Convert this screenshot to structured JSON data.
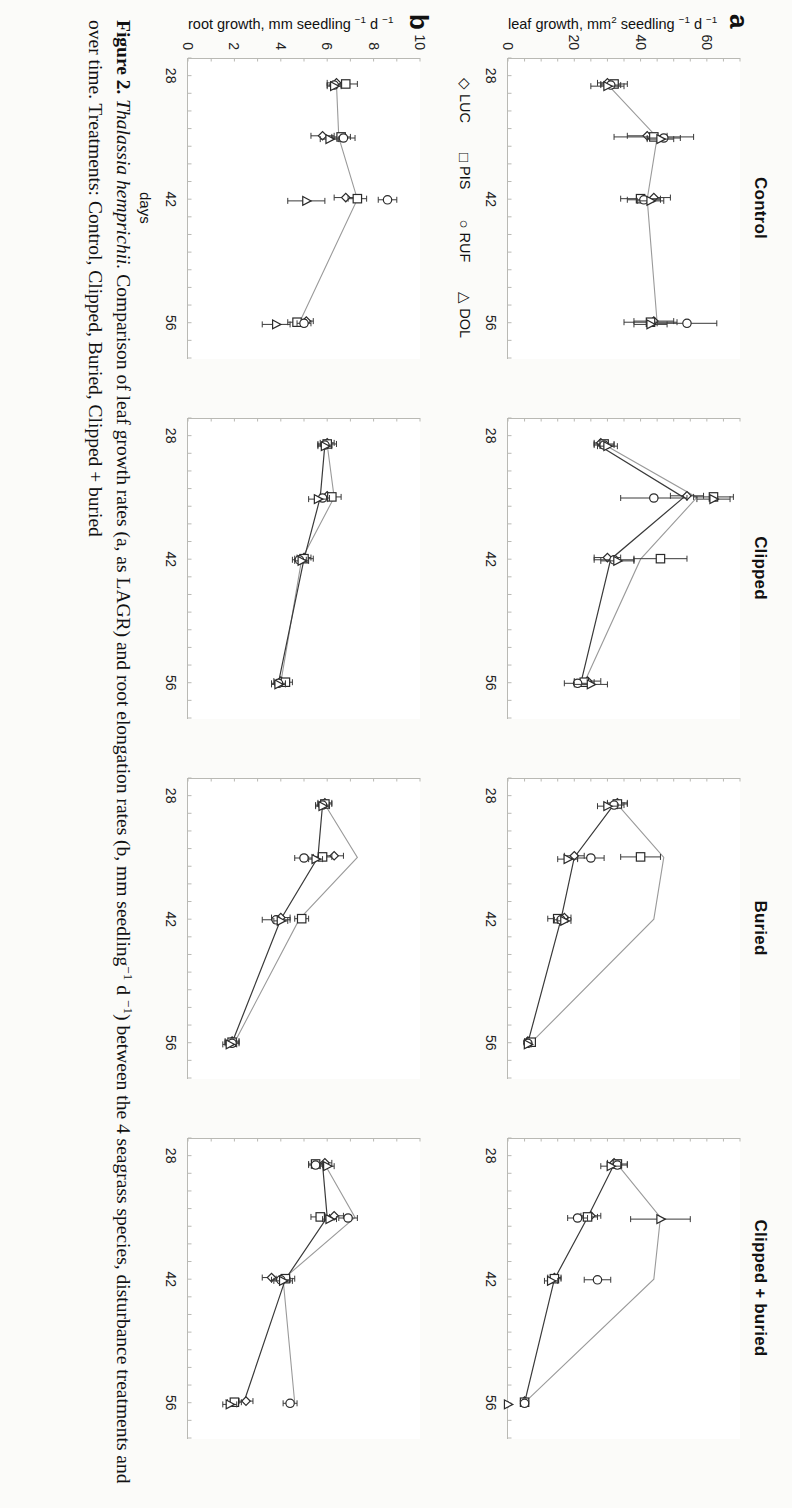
{
  "figure": {
    "caption_label": "Figure 2.",
    "caption_species": "Thalassia hemprichii.",
    "caption_text_1": "Comparison of leaf growth rates (a, as LAGR) and root elongation rates (b, mm seedling",
    "caption_sup_1": "−1",
    "caption_text_2": " d ",
    "caption_sup_2": "−1",
    "caption_text_3": ") between the",
    "caption_line2": "4 seagrass species, disturbance treatments and over time. Treatments: Control, Clipped, Buried, Clipped + buried"
  },
  "rows": [
    {
      "letter": "a",
      "y_label_main": "leaf growth, mm",
      "y_label_sup1": "2",
      "y_label_mid": " seedling ",
      "y_label_sup2": "−1",
      "y_label_end": " d ",
      "y_label_sup3": "−1",
      "yticks": [
        "0",
        "20",
        "40",
        "60"
      ],
      "ylim": [
        0,
        70
      ]
    },
    {
      "letter": "b",
      "y_label_main": "root growth, mm seedling ",
      "y_label_sup1": "",
      "y_label_mid": "",
      "y_label_sup2": "−1",
      "y_label_end": " d ",
      "y_label_sup3": "−1",
      "yticks": [
        "0",
        "2",
        "4",
        "6",
        "8",
        "10"
      ],
      "ylim": [
        0,
        10
      ]
    }
  ],
  "xaxis": {
    "name": "days",
    "ticks": [
      "28",
      "42",
      "56"
    ],
    "tick_values": [
      28,
      42,
      56
    ],
    "xlim": [
      26,
      60
    ]
  },
  "legend": {
    "items": [
      {
        "label": "LUC",
        "marker": "diamond"
      },
      {
        "label": "PIS",
        "marker": "square"
      },
      {
        "label": "RUF",
        "marker": "circle"
      },
      {
        "label": "DOL",
        "marker": "triangle"
      }
    ]
  },
  "colors": {
    "line_dark": "#3a3a3a",
    "line_light": "#9a9a9a",
    "axis": "#b9b9b4",
    "text": "#111111"
  },
  "chart_data": {
    "type": "line",
    "xlabel": "days",
    "grid": false,
    "legend_position": "below-left",
    "panels": [
      {
        "row": "a",
        "treatment": "Control",
        "ylabel": "leaf growth, mm2 seedling-1 d-1",
        "ylim": [
          0,
          70
        ],
        "x": [
          29,
          35,
          42,
          56
        ],
        "series": [
          {
            "name": "LUC",
            "marker": "diamond",
            "values": [
              30,
              42,
              44,
              44
            ],
            "errors": [
              3,
              6,
              5,
              6
            ]
          },
          {
            "name": "PIS",
            "marker": "square",
            "values": [
              32,
              44,
              40,
              43
            ],
            "errors": [
              4,
              12,
              6,
              8
            ]
          },
          {
            "name": "RUF",
            "marker": "circle",
            "values": [
              31,
              47,
              41,
              54
            ],
            "errors": [
              3,
              5,
              5,
              9
            ]
          },
          {
            "name": "DOL",
            "marker": "triangle",
            "values": [
              30,
              46,
              43,
              43
            ],
            "errors": [
              5,
              4,
              4,
              5
            ]
          }
        ],
        "mean_line": {
          "name": "mean",
          "color": "#9a9a9a",
          "values": [
            30,
            45,
            42,
            45
          ]
        }
      },
      {
        "row": "a",
        "treatment": "Clipped",
        "ylim": [
          0,
          70
        ],
        "x": [
          29,
          35,
          42,
          56
        ],
        "series": [
          {
            "name": "LUC",
            "marker": "diamond",
            "values": [
              28,
              54,
              30,
              24
            ],
            "errors": [
              2,
              5,
              4,
              4
            ]
          },
          {
            "name": "PIS",
            "marker": "square",
            "values": [
              29,
              62,
              46,
              23
            ],
            "errors": [
              3,
              6,
              8,
              3
            ]
          },
          {
            "name": "RUF",
            "marker": "circle",
            "values": [
              29,
              44,
              32,
              21
            ],
            "errors": [
              3,
              10,
              6,
              4
            ]
          },
          {
            "name": "DOL",
            "marker": "triangle",
            "values": [
              30,
              62,
              33,
              25
            ],
            "errors": [
              3,
              5,
              5,
              5
            ]
          }
        ],
        "mean_line": {
          "name": "mean-light",
          "color": "#9a9a9a",
          "values": [
            29,
            57,
            40,
            23
          ]
        },
        "mean_line_dark": {
          "name": "mean-dark",
          "color": "#3a3a3a",
          "values": [
            27,
            53,
            31,
            22
          ]
        }
      },
      {
        "row": "a",
        "treatment": "Buried",
        "ylim": [
          0,
          70
        ],
        "x": [
          29,
          35,
          42,
          56
        ],
        "series": [
          {
            "name": "LUC",
            "marker": "diamond",
            "values": [
              33,
              20,
              17,
              6
            ],
            "errors": [
              3,
              3,
              2,
              1
            ]
          },
          {
            "name": "PIS",
            "marker": "square",
            "values": [
              33,
              40,
              15,
              7
            ],
            "errors": [
              3,
              6,
              3,
              1
            ]
          },
          {
            "name": "RUF",
            "marker": "circle",
            "values": [
              32,
              25,
              16,
              6
            ],
            "errors": [
              3,
              4,
              2,
              1
            ]
          },
          {
            "name": "DOL",
            "marker": "triangle",
            "values": [
              30,
              18,
              17,
              6
            ],
            "errors": [
              3,
              3,
              2,
              1
            ]
          }
        ],
        "mean_line": {
          "name": "mean-light",
          "color": "#9a9a9a",
          "values": [
            33,
            47,
            44,
            7
          ]
        },
        "mean_line_dark": {
          "name": "mean-dark",
          "color": "#3a3a3a",
          "values": [
            32,
            20,
            16,
            6
          ]
        }
      },
      {
        "row": "a",
        "treatment": "Clipped + buried",
        "ylim": [
          0,
          70
        ],
        "x": [
          29,
          35,
          42,
          56
        ],
        "series": [
          {
            "name": "LUC",
            "marker": "diamond",
            "values": [
              32,
              25,
              14,
              5
            ],
            "errors": [
              2,
              3,
              2,
              1
            ]
          },
          {
            "name": "PIS",
            "marker": "square",
            "values": [
              33,
              24,
              14,
              5
            ],
            "errors": [
              3,
              3,
              2,
              1
            ]
          },
          {
            "name": "RUF",
            "marker": "circle",
            "values": [
              33,
              21,
              27,
              5
            ],
            "errors": [
              3,
              3,
              4,
              1
            ]
          },
          {
            "name": "DOL",
            "marker": "triangle",
            "values": [
              31,
              46,
              13,
              0
            ],
            "errors": [
              3,
              9,
              2,
              0
            ]
          }
        ],
        "mean_line": {
          "name": "mean-light",
          "color": "#9a9a9a",
          "values": [
            33,
            46,
            44,
            5
          ]
        },
        "mean_line_dark": {
          "name": "mean-dark",
          "color": "#3a3a3a",
          "values": [
            32,
            24,
            14,
            5
          ]
        }
      },
      {
        "row": "b",
        "treatment": "Control",
        "ylabel": "root growth, mm seedling-1 d-1",
        "ylim": [
          0,
          10
        ],
        "x": [
          29,
          35,
          42,
          56
        ],
        "series": [
          {
            "name": "LUC",
            "marker": "diamond",
            "values": [
              6.4,
              5.8,
              6.8,
              5.1
            ],
            "errors": [
              0.4,
              0.5,
              0.5,
              0.3
            ]
          },
          {
            "name": "PIS",
            "marker": "square",
            "values": [
              6.8,
              6.6,
              7.3,
              4.7
            ],
            "errors": [
              0.5,
              0.4,
              0.4,
              0.4
            ]
          },
          {
            "name": "RUF",
            "marker": "circle",
            "values": [
              6.3,
              6.7,
              8.6,
              5.0
            ],
            "errors": [
              0.3,
              0.5,
              0.4,
              0.3
            ]
          },
          {
            "name": "DOL",
            "marker": "triangle",
            "values": [
              6.3,
              6.1,
              5.1,
              3.8
            ],
            "errors": [
              0.3,
              0.4,
              0.8,
              0.6
            ]
          }
        ],
        "mean_line": {
          "name": "mean",
          "color": "#9a9a9a",
          "values": [
            6.4,
            6.5,
            7.3,
            4.8
          ]
        }
      },
      {
        "row": "b",
        "treatment": "Clipped",
        "ylim": [
          0,
          10
        ],
        "x": [
          29,
          35,
          42,
          56
        ],
        "series": [
          {
            "name": "LUC",
            "marker": "diamond",
            "values": [
              6.0,
              6.0,
              5.0,
              4.0
            ],
            "errors": [
              0.3,
              0.3,
              0.3,
              0.3
            ]
          },
          {
            "name": "PIS",
            "marker": "square",
            "values": [
              6.0,
              6.2,
              5.0,
              4.2
            ],
            "errors": [
              0.4,
              0.4,
              0.4,
              0.3
            ]
          },
          {
            "name": "RUF",
            "marker": "circle",
            "values": [
              5.9,
              5.8,
              4.8,
              3.9
            ],
            "errors": [
              0.3,
              0.3,
              0.3,
              0.3
            ]
          },
          {
            "name": "DOL",
            "marker": "triangle",
            "values": [
              5.9,
              5.6,
              4.9,
              3.9
            ],
            "errors": [
              0.3,
              0.4,
              0.3,
              0.3
            ]
          }
        ],
        "mean_line": {
          "name": "mean-light",
          "color": "#9a9a9a",
          "values": [
            6.0,
            6.3,
            4.9,
            4.0
          ]
        },
        "mean_line_dark": {
          "name": "mean-dark",
          "color": "#3a3a3a",
          "values": [
            5.9,
            5.7,
            5.0,
            3.9
          ]
        }
      },
      {
        "row": "b",
        "treatment": "Buried",
        "ylim": [
          0,
          10
        ],
        "x": [
          29,
          35,
          42,
          56
        ],
        "series": [
          {
            "name": "LUC",
            "marker": "diamond",
            "values": [
              5.9,
              6.3,
              4.0,
              1.9
            ],
            "errors": [
              0.3,
              0.4,
              0.4,
              0.3
            ]
          },
          {
            "name": "PIS",
            "marker": "square",
            "values": [
              5.9,
              5.8,
              4.9,
              1.9
            ],
            "errors": [
              0.3,
              0.4,
              0.3,
              0.3
            ]
          },
          {
            "name": "RUF",
            "marker": "circle",
            "values": [
              5.8,
              5.0,
              3.8,
              1.9
            ],
            "errors": [
              0.3,
              0.4,
              0.6,
              0.3
            ]
          },
          {
            "name": "DOL",
            "marker": "triangle",
            "values": [
              5.8,
              5.5,
              4.0,
              1.8
            ],
            "errors": [
              0.3,
              0.3,
              0.3,
              0.3
            ]
          }
        ],
        "mean_line": {
          "name": "mean-light",
          "color": "#9a9a9a",
          "values": [
            5.9,
            7.3,
            4.8,
            2.0
          ]
        },
        "mean_line_dark": {
          "name": "mean-dark",
          "color": "#3a3a3a",
          "values": [
            5.8,
            5.6,
            4.0,
            1.9
          ]
        }
      },
      {
        "row": "b",
        "treatment": "Clipped + buried",
        "ylim": [
          0,
          10
        ],
        "x": [
          29,
          35,
          42,
          56
        ],
        "series": [
          {
            "name": "LUC",
            "marker": "diamond",
            "values": [
              5.9,
              6.3,
              3.6,
              2.5
            ],
            "errors": [
              0.3,
              0.4,
              0.4,
              0.3
            ]
          },
          {
            "name": "PIS",
            "marker": "square",
            "values": [
              5.5,
              5.7,
              4.2,
              2.0
            ],
            "errors": [
              0.3,
              0.4,
              0.4,
              0.3
            ]
          },
          {
            "name": "RUF",
            "marker": "circle",
            "values": [
              5.5,
              6.9,
              4.0,
              4.4
            ],
            "errors": [
              0.3,
              0.4,
              0.4,
              0.3
            ]
          },
          {
            "name": "DOL",
            "marker": "triangle",
            "values": [
              6.0,
              6.1,
              4.1,
              1.8
            ],
            "errors": [
              0.3,
              0.3,
              0.4,
              0.3
            ]
          }
        ],
        "mean_line": {
          "name": "mean-light",
          "color": "#9a9a9a",
          "values": [
            5.9,
            7.2,
            4.1,
            4.6
          ]
        },
        "mean_line_dark": {
          "name": "mean-dark",
          "color": "#3a3a3a",
          "values": [
            5.8,
            6.0,
            4.2,
            2.4
          ]
        }
      }
    ]
  }
}
